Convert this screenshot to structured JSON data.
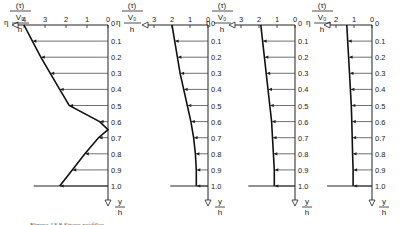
{
  "figure": {
    "caption": "Figure 13.8  Stress profiles",
    "x_axis_label": {
      "numerator": "(τ)",
      "middle": "V₀",
      "prefix": "η",
      "denominator": "h"
    },
    "y_axis_label": {
      "numerator": "y",
      "denominator": "h"
    },
    "y_ticks": [
      "0",
      "0.1",
      "0.2",
      "0.3",
      "0.4",
      "0.5",
      "0.6",
      "0.7",
      "0.8",
      "0.9",
      "1.0"
    ]
  },
  "chart_data": [
    {
      "type": "line",
      "title": "Panel 1",
      "x_ticks": [
        "4",
        "3",
        "2",
        "1",
        "0"
      ],
      "xlabel": "η(τ)/(V0/h)",
      "ylabel": "y/h",
      "y": [
        0,
        0.1,
        0.2,
        0.3,
        0.4,
        0.5,
        0.6,
        0.65,
        0.7,
        0.8,
        0.9,
        1.0
      ],
      "x": [
        4.0,
        3.6,
        3.2,
        2.75,
        2.3,
        1.85,
        0.4,
        0.0,
        0.45,
        1.1,
        1.7,
        2.3
      ]
    },
    {
      "type": "line",
      "title": "Panel 2",
      "x_ticks": [
        "3",
        "2",
        "1",
        "0"
      ],
      "xlabel": "η(τ)/(V0/h)",
      "ylabel": "y/h",
      "y": [
        0,
        0.1,
        0.2,
        0.3,
        0.4,
        0.5,
        0.6,
        0.7,
        0.8,
        0.9,
        1.0
      ],
      "x": [
        2.0,
        1.85,
        1.7,
        1.55,
        1.35,
        1.15,
        0.95,
        0.8,
        0.7,
        0.65,
        0.65
      ]
    },
    {
      "type": "line",
      "title": "Panel 3",
      "x_ticks": [
        "3",
        "2",
        "1",
        "0"
      ],
      "xlabel": "η(τ)/(V0/h)",
      "ylabel": "y/h",
      "y": [
        0,
        0.1,
        0.2,
        0.3,
        0.4,
        0.5,
        0.6,
        0.7,
        0.8,
        0.9,
        1.0
      ],
      "x": [
        1.9,
        1.8,
        1.7,
        1.6,
        1.5,
        1.4,
        1.3,
        1.25,
        1.2,
        1.15,
        1.15
      ]
    },
    {
      "type": "line",
      "title": "Panel 4",
      "x_ticks": [
        "2",
        "1",
        "0"
      ],
      "xlabel": "η(τ)/(V0/h)",
      "ylabel": "y/h",
      "y": [
        0,
        0.1,
        0.2,
        0.3,
        0.4,
        0.5,
        0.6,
        0.7,
        0.8,
        0.9,
        1.0
      ],
      "x": [
        1.4,
        1.35,
        1.3,
        1.25,
        1.2,
        1.15,
        1.12,
        1.1,
        1.08,
        1.05,
        1.05
      ]
    }
  ]
}
